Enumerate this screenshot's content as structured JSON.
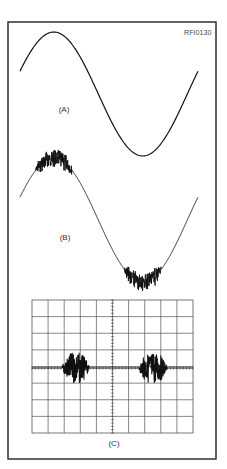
{
  "figure": {
    "reference_id": "RFI0130",
    "frame": {
      "x1": 8,
      "y1": 22,
      "x2": 216,
      "y2": 459,
      "stroke": "#222222"
    },
    "panels": [
      {
        "id": "A",
        "label": "(A)",
        "label_pos": [
          64,
          106
        ],
        "description": "Clean sine wave",
        "wave": {
          "x_start": 20,
          "x_end": 198,
          "center_y": 94,
          "amplitude": 62,
          "cycles": 1.0,
          "phase_start": 0.06,
          "noise": false
        }
      },
      {
        "id": "B",
        "label": "(B)",
        "label_pos": [
          65,
          234
        ],
        "description": "Sine wave with noise on the peaks",
        "wave": {
          "x_start": 20,
          "x_end": 198,
          "center_y": 220,
          "amplitude": 62,
          "cycles": 1.0,
          "phase_start": 0.06,
          "noise": true,
          "noise_threshold": 0.8,
          "noise_amplitude": 7
        }
      },
      {
        "id": "C",
        "label": "(C)",
        "label_pos": [
          114,
          440
        ],
        "description": "Oscilloscope display with two noise bursts",
        "scope": {
          "x": 32,
          "y": 300,
          "width": 161,
          "height": 133,
          "cols": 10,
          "rows": 8,
          "grid_color": "#555555",
          "baseline_y": 368,
          "bursts": [
            {
              "x_start": 62,
              "x_end": 89,
              "amplitude": 16
            },
            {
              "x_start": 139,
              "x_end": 167,
              "amplitude": 16
            }
          ]
        }
      }
    ]
  }
}
